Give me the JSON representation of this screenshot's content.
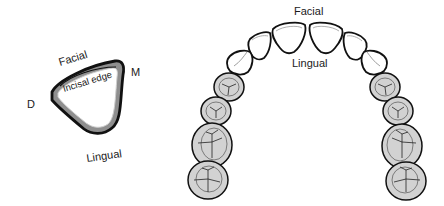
{
  "figure": {
    "left_diagram": {
      "title": "Single incisor cross-section",
      "labels": {
        "facial": "Facial",
        "mesial": "M",
        "distal": "D",
        "incisal_edge": "Incisal edge",
        "lingual": "Lingual"
      }
    },
    "right_diagram": {
      "title": "Dental arch (occlusal view)",
      "labels": {
        "facial": "Facial",
        "lingual": "Lingual"
      },
      "teeth_count": 14
    },
    "colors": {
      "outline": "#111111",
      "tooth_fill_anterior": "#ffffff",
      "tooth_fill_posterior": "#d2d2d2",
      "shading_band": "#9a9a9a",
      "background": "#ffffff"
    }
  }
}
